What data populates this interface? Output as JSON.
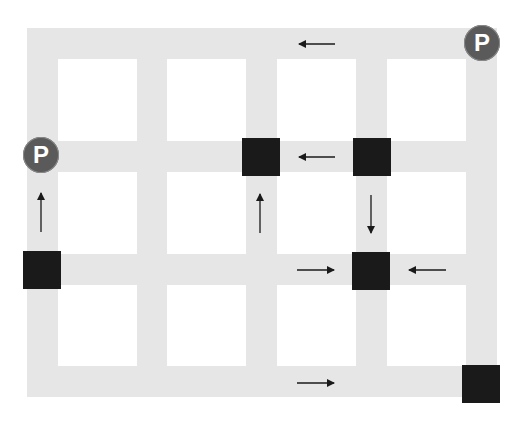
{
  "diagram": {
    "type": "street-grid-traffic-flow",
    "colors": {
      "road": "#e6e6e6",
      "block": "#1a1a1a",
      "parking_fill": "#5a5a5a",
      "parking_text": "#ffffff",
      "arrow": "#1a1a1a",
      "background": "#ffffff"
    },
    "grid": {
      "columns": 4,
      "rows": 3
    },
    "parking_markers": [
      {
        "label": "P",
        "position": "top-right corner"
      },
      {
        "label": "P",
        "position": "left edge, row 1 intersection"
      }
    ],
    "blocked_intersections": [
      {
        "position": "row 1, column 3"
      },
      {
        "position": "row 1, column 4"
      },
      {
        "position": "row 2, column 4"
      },
      {
        "position": "row 2, left edge"
      },
      {
        "position": "bottom-right corner"
      }
    ],
    "arrows": [
      {
        "direction": "left",
        "location": "top road"
      },
      {
        "direction": "left",
        "location": "row 1 road, between columns 3 and 4"
      },
      {
        "direction": "right",
        "location": "row 2 road, toward column 4"
      },
      {
        "direction": "left",
        "location": "row 2 road, toward column 4 from right"
      },
      {
        "direction": "right",
        "location": "bottom road"
      },
      {
        "direction": "up",
        "location": "left edge road"
      },
      {
        "direction": "up",
        "location": "column 3 road"
      },
      {
        "direction": "down",
        "location": "column 4 road"
      }
    ]
  }
}
